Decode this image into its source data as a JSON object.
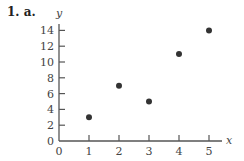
{
  "problem_label": "1. a.",
  "chart_data": {
    "type": "scatter",
    "title": "",
    "xlabel": "x",
    "ylabel": "y",
    "xlim": [
      0,
      5.4
    ],
    "ylim": [
      0,
      15
    ],
    "x_ticks": [
      1,
      2,
      3,
      4,
      5
    ],
    "y_ticks": [
      2,
      4,
      6,
      8,
      10,
      12,
      14
    ],
    "x_tick_labels": [
      "0",
      "1",
      "2",
      "3",
      "4",
      "5"
    ],
    "y_tick_labels": [
      "0",
      "2",
      "4",
      "6",
      "8",
      "10",
      "12",
      "14"
    ],
    "grid": false,
    "points": [
      {
        "x": 1,
        "y": 3
      },
      {
        "x": 2,
        "y": 7
      },
      {
        "x": 3,
        "y": 5
      },
      {
        "x": 4,
        "y": 11
      },
      {
        "x": 5,
        "y": 14
      }
    ],
    "colors": {
      "axis": "#555555",
      "point": "#333333"
    }
  }
}
